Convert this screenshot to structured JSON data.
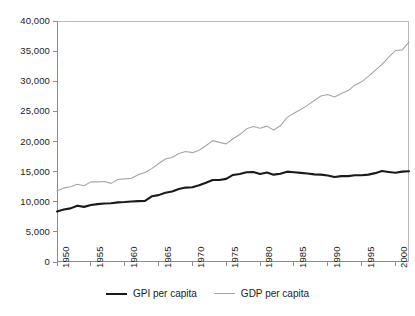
{
  "chart_data": {
    "type": "line",
    "title": "",
    "xlabel": "",
    "ylabel": "",
    "xlim": [
      1950,
      2002
    ],
    "ylim": [
      0,
      40000
    ],
    "grid": false,
    "legend_position": "bottom-center",
    "y_ticks": [
      "40,000",
      "35,000",
      "30,000",
      "25,000",
      "20,000",
      "15,000",
      "10,000",
      "5,000",
      "0"
    ],
    "y_tick_values": [
      40000,
      35000,
      30000,
      25000,
      20000,
      15000,
      10000,
      5000,
      0
    ],
    "x_ticks": [
      "1950",
      "1955",
      "1960",
      "1965",
      "1970",
      "1975",
      "1980",
      "1985",
      "1990",
      "1995",
      "2000"
    ],
    "x_tick_values": [
      1950,
      1955,
      1960,
      1965,
      1970,
      1975,
      1980,
      1985,
      1990,
      1995,
      2000
    ],
    "x": [
      1950,
      1951,
      1952,
      1953,
      1954,
      1955,
      1956,
      1957,
      1958,
      1959,
      1960,
      1961,
      1962,
      1963,
      1964,
      1965,
      1966,
      1967,
      1968,
      1969,
      1970,
      1971,
      1972,
      1973,
      1974,
      1975,
      1976,
      1977,
      1978,
      1979,
      1980,
      1981,
      1982,
      1983,
      1984,
      1985,
      1986,
      1987,
      1988,
      1989,
      1990,
      1991,
      1992,
      1993,
      1994,
      1995,
      1996,
      1997,
      1998,
      1999,
      2000,
      2001,
      2002
    ],
    "series": [
      {
        "name": "GPI per capita",
        "color": "#1a1a1a",
        "width": 2.1,
        "values": [
          8400,
          8700,
          8900,
          9350,
          9150,
          9450,
          9600,
          9700,
          9750,
          9900,
          9950,
          10050,
          10100,
          10150,
          10900,
          11100,
          11500,
          11700,
          12100,
          12350,
          12400,
          12750,
          13150,
          13600,
          13600,
          13800,
          14450,
          14600,
          14900,
          14950,
          14600,
          14850,
          14500,
          14650,
          15000,
          14900,
          14800,
          14700,
          14550,
          14500,
          14350,
          14100,
          14250,
          14250,
          14400,
          14400,
          14500,
          14750,
          15100,
          14950,
          14800,
          15000,
          15050
        ]
      },
      {
        "name": "GDP per capita",
        "color": "#a6a6a6",
        "width": 1.1,
        "values": [
          11800,
          12300,
          12500,
          12900,
          12650,
          13300,
          13300,
          13350,
          13050,
          13700,
          13800,
          13900,
          14500,
          14850,
          15500,
          16300,
          17100,
          17350,
          18000,
          18350,
          18150,
          18550,
          19300,
          20150,
          19850,
          19600,
          20450,
          21150,
          22100,
          22500,
          22200,
          22550,
          21900,
          22600,
          24000,
          24700,
          25300,
          26000,
          26800,
          27550,
          27800,
          27400,
          27950,
          28450,
          29350,
          29900,
          30800,
          31800,
          32800,
          34000,
          35100,
          35200,
          36500
        ]
      }
    ]
  },
  "legend": {
    "entries": [
      {
        "label": "GPI per capita"
      },
      {
        "label": "GDP per capita"
      }
    ]
  }
}
